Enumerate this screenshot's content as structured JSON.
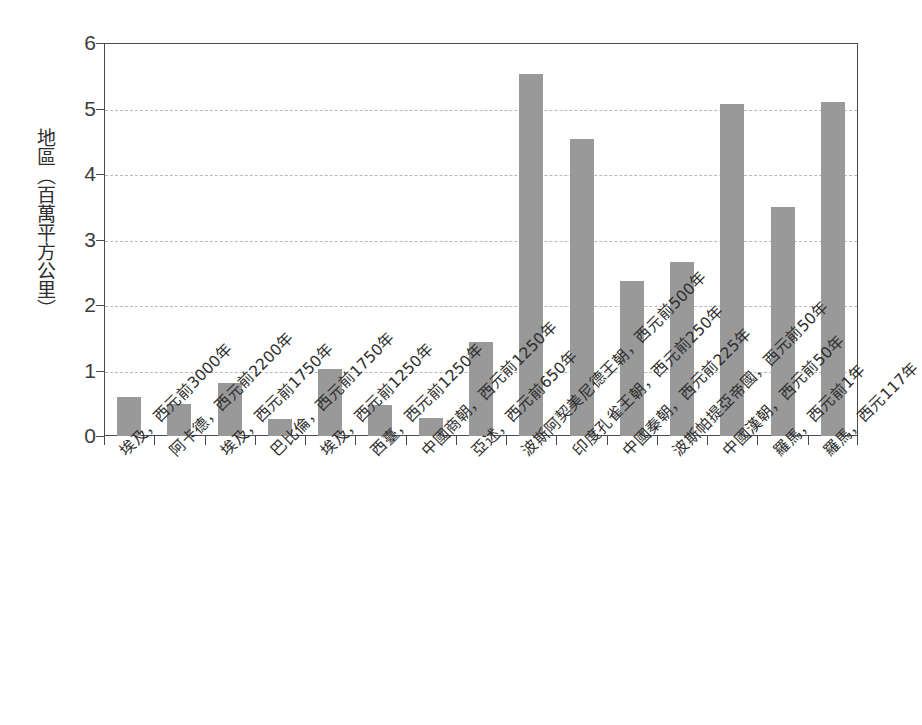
{
  "chart_data": {
    "type": "bar",
    "title": "",
    "subtitle": "",
    "xlabel": "",
    "ylabel": "地區（百萬平方公里）",
    "ylim": [
      0,
      6
    ],
    "ytick_labels": [
      "0",
      "1",
      "2",
      "3",
      "4",
      "5",
      "6"
    ],
    "ytick_values": [
      0,
      1,
      2,
      3,
      4,
      5,
      6
    ],
    "grid": "horizontal-dashed",
    "legend": "none",
    "bar_color": "#999999",
    "axis_color": "#4a4a4a",
    "grid_color": "#b9b9b9",
    "categories": [
      "埃及，西元前3000年",
      "阿卡德，西元前2200年",
      "埃及，西元前1750年",
      "巴比倫，西元前1750年",
      "埃及，西元前1250年",
      "西臺，西元前1250年",
      "中國商朝，西元前1250年",
      "亞述，西元前650年",
      "波斯阿契美尼德王朝，西元前500年",
      "印度孔雀王朝，西元前250年",
      "中國秦朝，西元前225年",
      "波斯帕提亞帝國，西元前50年",
      "中國漢朝，西元前50年",
      "羅馬，西元前1年",
      "羅馬，西元117年"
    ],
    "values": [
      0.6,
      0.49,
      0.81,
      0.26,
      1.02,
      0.47,
      0.27,
      1.44,
      5.52,
      4.54,
      2.36,
      2.66,
      5.07,
      3.49,
      5.1
    ]
  }
}
